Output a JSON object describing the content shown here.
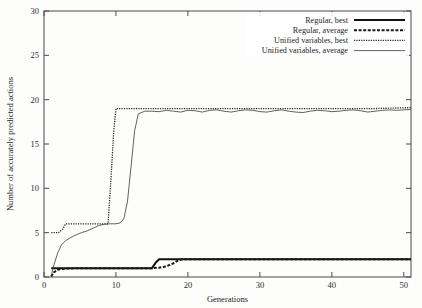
{
  "figure": {
    "background_color": "#fdfdfc",
    "ink_color": "#1d1d1d",
    "axis_color": "#4a4a4a"
  },
  "chart_data": {
    "type": "line",
    "title": "",
    "xlabel": "Generations",
    "ylabel": "Number of accurately predicted actions",
    "xlim": [
      0,
      51
    ],
    "ylim": [
      0,
      30
    ],
    "xticks": [
      0,
      10,
      20,
      30,
      40,
      50
    ],
    "yticks": [
      0,
      5,
      10,
      15,
      20,
      25,
      30
    ],
    "grid": false,
    "legend_position": "top-right",
    "series": [
      {
        "name": "Regular, best",
        "style": "solid-thick",
        "color": "#111111",
        "x": [
          1,
          2,
          3,
          6,
          10,
          14,
          15,
          15.6,
          16,
          20,
          30,
          40,
          51
        ],
        "values": [
          1,
          1,
          1,
          1,
          1,
          1,
          1,
          1.7,
          2,
          2,
          2,
          2,
          2
        ]
      },
      {
        "name": "Regular, average",
        "style": "dashed-thick",
        "color": "#1a1a1a",
        "x": [
          1,
          1.4,
          2,
          3,
          5,
          8,
          12,
          15,
          16,
          17,
          18,
          18.6,
          19.2,
          22,
          30,
          40,
          51
        ],
        "values": [
          0.05,
          0.55,
          0.85,
          0.95,
          1.0,
          1.0,
          1.0,
          1.0,
          1.05,
          1.2,
          1.55,
          1.85,
          2.0,
          2.0,
          2.0,
          2.0,
          2.0
        ]
      },
      {
        "name": "Unified variables, best",
        "style": "dotted-fine",
        "color": "#222222",
        "x": [
          1,
          2,
          2.6,
          3,
          4,
          6,
          8,
          8.9,
          9.3,
          9.7,
          10,
          12,
          16,
          20,
          26,
          32,
          40,
          46,
          51
        ],
        "values": [
          5,
          5,
          5.4,
          6,
          6,
          6,
          6,
          6,
          11,
          16.5,
          19,
          19,
          19,
          19,
          19,
          19,
          19,
          19,
          19.1
        ]
      },
      {
        "name": "Unified variables, average",
        "style": "solid-thin",
        "color": "#3a3a3a",
        "x": [
          1,
          1.4,
          1.9,
          2.4,
          3,
          3.6,
          4.3,
          5.2,
          6,
          6.8,
          7.6,
          8.4,
          9.2,
          10,
          10.6,
          11.1,
          11.6,
          12.1,
          12.6,
          13.1,
          14,
          15,
          16,
          17,
          18,
          19,
          20,
          21,
          22,
          23,
          24,
          25,
          26,
          27,
          28,
          29,
          30,
          31,
          32,
          33,
          34,
          35,
          36,
          37,
          38,
          39,
          40,
          41,
          42,
          43,
          44,
          45,
          46,
          47,
          48,
          49,
          50,
          51
        ],
        "values": [
          0.1,
          1.4,
          2.7,
          3.6,
          4.1,
          4.4,
          4.7,
          5.0,
          5.2,
          5.5,
          5.8,
          5.95,
          6.0,
          6.0,
          6.1,
          6.6,
          8.5,
          12.5,
          16.5,
          18.4,
          18.7,
          18.7,
          18.65,
          18.8,
          18.7,
          18.6,
          18.8,
          18.75,
          18.6,
          18.8,
          18.85,
          18.7,
          18.6,
          18.75,
          18.85,
          18.8,
          18.65,
          18.6,
          18.75,
          18.85,
          18.7,
          18.6,
          18.55,
          18.7,
          18.8,
          18.75,
          18.65,
          18.7,
          18.8,
          18.85,
          18.75,
          18.6,
          18.7,
          18.8,
          18.85,
          18.8,
          18.85,
          18.9
        ]
      }
    ]
  },
  "legend": {
    "entries": [
      {
        "label": "Regular, best",
        "style": "solid-thick"
      },
      {
        "label": "Regular, average",
        "style": "dashed-thick"
      },
      {
        "label": "Unified variables, best",
        "style": "dotted-fine"
      },
      {
        "label": "Unified variables, average",
        "style": "solid-thin"
      }
    ]
  }
}
